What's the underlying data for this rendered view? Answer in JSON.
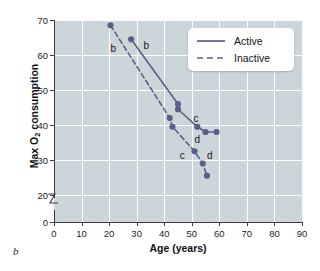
{
  "panel_letter": "b",
  "chart_data": {
    "type": "line",
    "title": "",
    "xlabel": "Age (years)",
    "ylabel_text": "Max O",
    "ylabel_sub": "2",
    "ylabel_tail": " consumption",
    "xlim": [
      0,
      90
    ],
    "ylim": [
      0,
      70
    ],
    "y_axis_break": true,
    "y_break_between": [
      0,
      20
    ],
    "grid": true,
    "grid_color": "#fdfefe",
    "plot_background": "#ccd6da",
    "series_color": "#5a5f8a",
    "xticks": [
      0,
      10,
      20,
      30,
      40,
      50,
      60,
      70,
      80,
      90
    ],
    "xtick_labels": [
      "0",
      "10",
      "20",
      "30",
      "40",
      "50",
      "60",
      "70",
      "80",
      "90"
    ],
    "yticks": [
      0,
      20,
      30,
      40,
      50,
      60,
      70
    ],
    "ytick_labels": [
      "0",
      "20",
      "30",
      "40",
      "50",
      "60",
      "70"
    ],
    "legend_position": "upper right",
    "series": [
      {
        "name": "Active",
        "style": "solid",
        "segments": [
          {
            "points": [
              [
                28,
                64.5
              ],
              [
                45,
                46
              ]
            ]
          },
          {
            "points": [
              [
                45,
                44.5
              ],
              [
                52,
                39.5
              ],
              [
                55,
                38
              ],
              [
                59,
                38
              ]
            ]
          }
        ],
        "points": [
          [
            28,
            64.5
          ],
          [
            45,
            46
          ],
          [
            45,
            44.5
          ],
          [
            52,
            39.5
          ],
          [
            55,
            38
          ],
          [
            59,
            38
          ]
        ]
      },
      {
        "name": "Inactive",
        "style": "dashed",
        "segments": [
          {
            "points": [
              [
                20.5,
                68.5
              ],
              [
                42,
                42
              ],
              [
                43,
                39.5
              ],
              [
                51,
                32.5
              ],
              [
                54,
                29
              ],
              [
                55.5,
                25.5
              ]
            ]
          }
        ],
        "points": [
          [
            20.5,
            68.5
          ],
          [
            42,
            42
          ],
          [
            43,
            39.5
          ],
          [
            51,
            32.5
          ],
          [
            54,
            29
          ],
          [
            55.5,
            25.5
          ]
        ]
      }
    ],
    "annotations": [
      {
        "text": "b",
        "x": 21.5,
        "y": 62.0
      },
      {
        "text": "b",
        "x": 33.5,
        "y": 63.0
      },
      {
        "text": "c",
        "x": 51.5,
        "y": 42.0
      },
      {
        "text": "c",
        "x": 46.5,
        "y": 31.5
      },
      {
        "text": "d",
        "x": 52.0,
        "y": 36.0
      },
      {
        "text": "d",
        "x": 56.5,
        "y": 31.5
      }
    ]
  },
  "legend": {
    "entries": [
      {
        "label": "Active",
        "style": "solid"
      },
      {
        "label": "Inactive",
        "style": "dashed"
      }
    ]
  }
}
